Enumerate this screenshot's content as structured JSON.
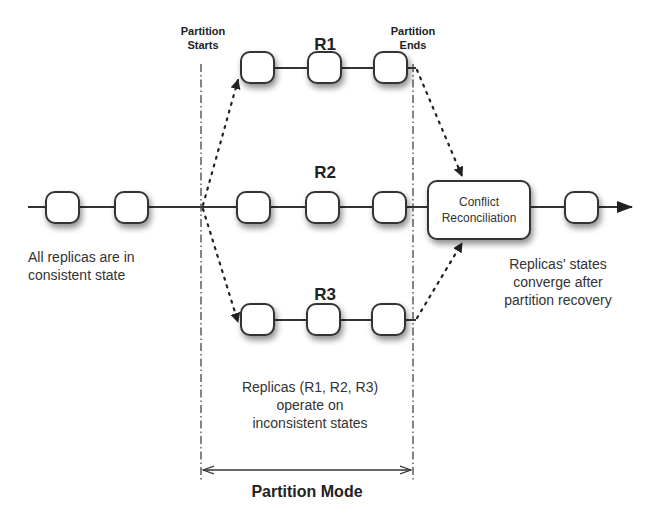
{
  "diagram": {
    "title": "Partition Mode",
    "boundaries": {
      "start_label_line1": "Partition",
      "start_label_line2": "Starts",
      "end_label_line1": "Partition",
      "end_label_line2": "Ends"
    },
    "replicas": [
      {
        "id": "R1",
        "label": "R1",
        "states": 3
      },
      {
        "id": "R2",
        "label": "R2",
        "states": 3
      },
      {
        "id": "R3",
        "label": "R3",
        "states": 3
      }
    ],
    "pre_partition_states": 2,
    "post_partition_states": 1,
    "reconciliation": {
      "line1": "Conflict",
      "line2": "Reconciliation"
    },
    "notes": {
      "left_line1": "All replicas are in",
      "left_line2": "consistent state",
      "middle_line1": "Replicas (R1, R2, R3)",
      "middle_line2": "operate on",
      "middle_line3": "inconsistent states",
      "right_line1": "Replicas' states",
      "right_line2": "converge after",
      "right_line3": "partition recovery"
    },
    "colors": {
      "line": "#333333",
      "box_fill": "#ffffff",
      "background": "#ffffff"
    }
  }
}
